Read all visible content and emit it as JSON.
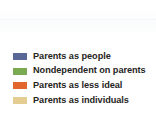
{
  "chart_data": {
    "type": "bar",
    "title": "",
    "xlabel": "",
    "ylabel": "",
    "legend_position": "bottom-left",
    "grid": false,
    "categories": [],
    "series": [
      {
        "name": "Parents as people",
        "color": "#5b6897",
        "values": []
      },
      {
        "name": "Nondependent on parents",
        "color": "#7aaa52",
        "values": []
      },
      {
        "name": "Parents as less ideal",
        "color": "#e2672f",
        "values": []
      },
      {
        "name": "Parents as individuals",
        "color": "#e4cc92",
        "values": []
      }
    ]
  },
  "legend": {
    "items": [
      {
        "label": "Parents as people",
        "color": "#5b6897",
        "swatch_name": "legend-swatch-parents-as-people"
      },
      {
        "label": "Nondependent on parents",
        "color": "#7aaa52",
        "swatch_name": "legend-swatch-nondependent-on-parents"
      },
      {
        "label": "Parents as less ideal",
        "color": "#e2672f",
        "swatch_name": "legend-swatch-parents-as-less-ideal"
      },
      {
        "label": "Parents as individuals",
        "color": "#e4cc92",
        "swatch_name": "legend-swatch-parents-as-individuals"
      }
    ]
  },
  "canvas": {
    "background": "#ffffff",
    "text_color": "#262522"
  }
}
